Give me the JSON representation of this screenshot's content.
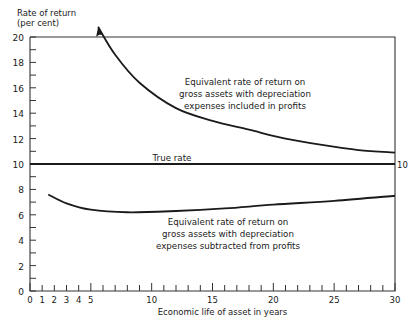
{
  "chart_data": {
    "type": "line",
    "title": "",
    "xlabel": "Economic life of asset in years",
    "ylabel": "Rate of return (per cent)",
    "ylabel_lines": [
      "Rate of return",
      "(per cent)"
    ],
    "xlim": [
      0,
      30
    ],
    "ylim": [
      0,
      20
    ],
    "x_ticks": [
      0,
      1,
      2,
      3,
      4,
      5,
      10,
      15,
      20,
      25,
      30
    ],
    "y_ticks": [
      0,
      2,
      4,
      6,
      8,
      10,
      12,
      14,
      16,
      18,
      20
    ],
    "right_label": "10",
    "grid": false,
    "series": [
      {
        "name": "Equivalent rate of return on gross assets with depreciation expenses included in profits",
        "label_lines": [
          "Equivalent rate of return on",
          "gross assets with depreciation",
          "expenses included in profits"
        ],
        "x": [
          5.6,
          7,
          9,
          12,
          15,
          18,
          21,
          24,
          27,
          30
        ],
        "y": [
          20.8,
          18.6,
          16.4,
          14.4,
          13.4,
          12.7,
          12.0,
          11.5,
          11.1,
          10.9
        ],
        "arrow_at_start": true
      },
      {
        "name": "True rate",
        "label_lines": [
          "True rate"
        ],
        "x": [
          0,
          30
        ],
        "y": [
          10,
          10
        ]
      },
      {
        "name": "Equivalent rate of return on gross assets with depreciation expenses subtracted from profits",
        "label_lines": [
          "Equivalent rate of return on",
          "gross assets with depreciation",
          "expenses subtracted from profits"
        ],
        "x": [
          1.5,
          3,
          5,
          8,
          12,
          16,
          20,
          25,
          30
        ],
        "y": [
          7.6,
          6.9,
          6.4,
          6.2,
          6.3,
          6.5,
          6.8,
          7.1,
          7.5
        ]
      }
    ]
  }
}
